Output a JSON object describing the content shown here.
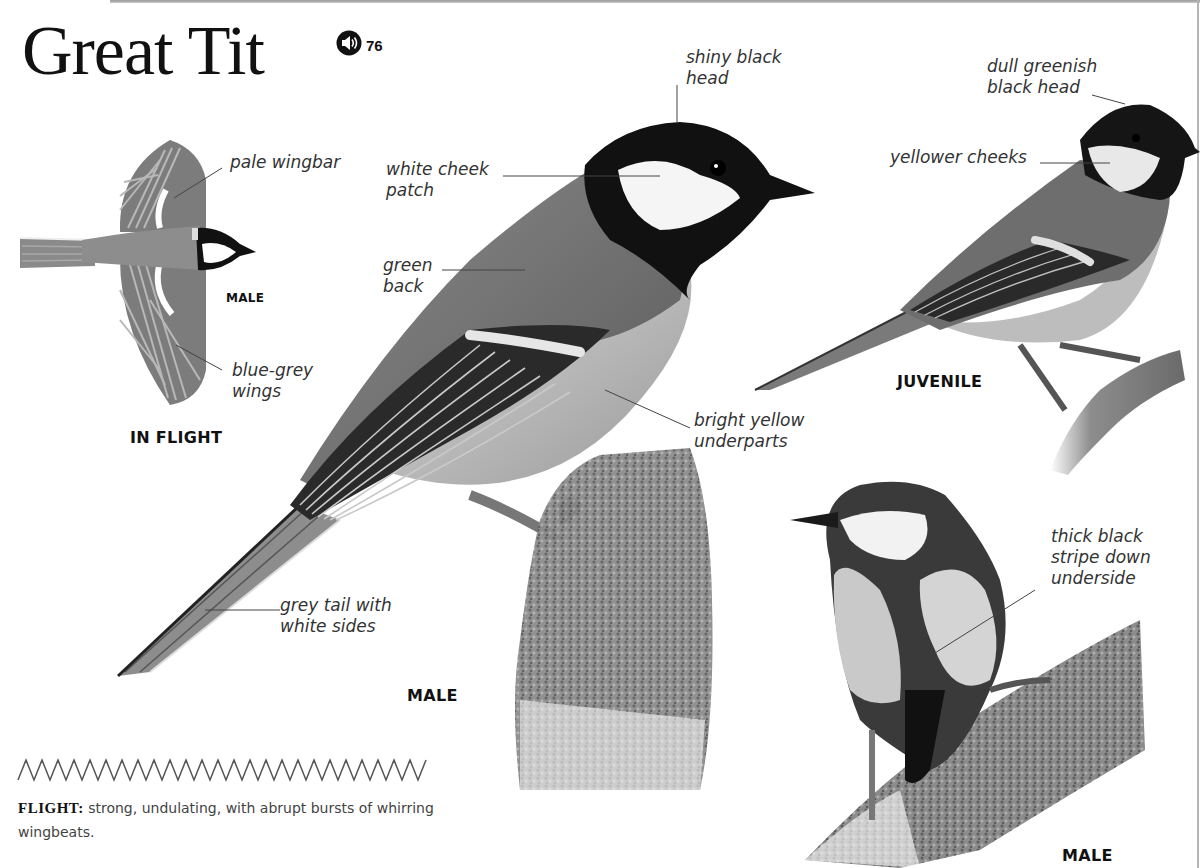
{
  "page": {
    "title": "Great Tit",
    "audio": {
      "icon": "speaker-icon",
      "track_number": "76"
    }
  },
  "figures": {
    "in_flight": {
      "caption": "IN FLIGHT",
      "sex_label": "MALE",
      "annotations": [
        "pale wingbar",
        "blue-grey\nwings"
      ]
    },
    "male_side": {
      "caption": "MALE",
      "annotations": [
        "shiny black\nhead",
        "white cheek\npatch",
        "green\nback",
        "bright yellow\nunderparts",
        "grey tail with\nwhite sides"
      ]
    },
    "juvenile": {
      "caption": "JUVENILE",
      "annotations": [
        "dull greenish\nblack head",
        "yellower cheeks"
      ]
    },
    "male_front": {
      "caption": "MALE",
      "annotations": [
        "thick black\nstripe down\nunderside"
      ]
    }
  },
  "flight": {
    "icon": "zigzag-flight-pattern-icon",
    "label": "FLIGHT:",
    "description": "strong, undulating, with abrupt bursts of whirring wingbeats."
  },
  "colors": {
    "text": "#1a1a1a",
    "annotation_text": "#333333",
    "leader_line": "#444444",
    "bird_black": "#121212",
    "bird_grey": "#7a7a7a",
    "rule": "#b5b5b5"
  }
}
